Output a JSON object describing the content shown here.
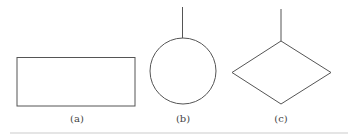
{
  "figure": {
    "panels": [
      {
        "id": "a",
        "shape": "rectangle",
        "label": "(a)",
        "has_stem": false
      },
      {
        "id": "b",
        "shape": "circle",
        "label": "(b)",
        "has_stem": true
      },
      {
        "id": "c",
        "shape": "diamond",
        "label": "(c)",
        "has_stem": true
      }
    ],
    "stroke_color": "#555555",
    "background": "#ffffff"
  }
}
